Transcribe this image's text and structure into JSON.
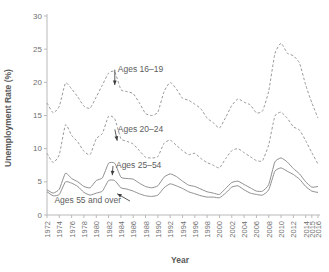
{
  "chart_data": {
    "type": "line",
    "title": "",
    "xlabel": "Year",
    "ylabel": "Unemployment Rate (%)",
    "xlim": [
      1972,
      2016
    ],
    "ylim": [
      0,
      30
    ],
    "yticks": [
      0,
      5,
      10,
      15,
      20,
      25,
      30
    ],
    "ytick_labels": [
      "0",
      "5",
      "10",
      "15",
      "20",
      "25",
      "30"
    ],
    "xticks": [
      1972,
      1974,
      1976,
      1978,
      1980,
      1982,
      1984,
      1986,
      1988,
      1990,
      1992,
      1994,
      1996,
      1998,
      2000,
      2002,
      2004,
      2006,
      2008,
      2010,
      2012,
      2014,
      2015,
      2016
    ],
    "xtick_labels": [
      "1972",
      "1974",
      "1976",
      "1978",
      "1980",
      "1982",
      "1984",
      "1986",
      "1988",
      "1990",
      "1992",
      "1994",
      "1996",
      "1998",
      "2000",
      "2002",
      "2004",
      "2006",
      "2008",
      "2010",
      "2012",
      "2014",
      "2015",
      "2016"
    ],
    "grid": false,
    "legend_position": "inline-annotations",
    "x": [
      1972,
      1973,
      1974,
      1975,
      1976,
      1977,
      1978,
      1979,
      1980,
      1981,
      1982,
      1983,
      1984,
      1985,
      1986,
      1987,
      1988,
      1989,
      1990,
      1991,
      1992,
      1993,
      1994,
      1995,
      1996,
      1997,
      1998,
      1999,
      2000,
      2001,
      2002,
      2003,
      2004,
      2005,
      2006,
      2007,
      2008,
      2009,
      2010,
      2011,
      2012,
      2013,
      2014,
      2015,
      2016
    ],
    "series": [
      {
        "name": "Ages 16-19",
        "style": "dashed",
        "color": "#9a9a9a",
        "values": [
          16.9,
          15.4,
          16.4,
          19.9,
          19.0,
          17.8,
          16.4,
          16.1,
          17.8,
          19.6,
          21.4,
          21.6,
          18.9,
          18.6,
          18.3,
          16.9,
          15.3,
          15.0,
          15.5,
          18.6,
          20.0,
          19.0,
          17.6,
          17.3,
          16.7,
          16.0,
          14.6,
          13.9,
          13.1,
          14.7,
          16.5,
          17.5,
          17.0,
          16.6,
          15.4,
          15.7,
          18.7,
          24.3,
          25.9,
          24.4,
          24.0,
          22.9,
          19.6,
          16.9,
          14.6
        ]
      },
      {
        "name": "Ages 20-24",
        "style": "dashed",
        "color": "#9a9a9a",
        "values": [
          9.3,
          7.9,
          9.1,
          13.6,
          12.0,
          11.0,
          9.6,
          9.1,
          11.5,
          12.3,
          14.9,
          14.5,
          11.5,
          11.1,
          10.7,
          9.7,
          8.7,
          8.6,
          8.8,
          10.8,
          11.3,
          10.5,
          9.7,
          9.1,
          9.3,
          8.5,
          7.9,
          7.5,
          7.1,
          8.5,
          9.7,
          10.0,
          9.4,
          8.8,
          8.2,
          8.2,
          10.6,
          14.9,
          15.5,
          14.6,
          13.3,
          12.8,
          11.2,
          9.4,
          7.7
        ]
      },
      {
        "name": "Ages 25-54",
        "style": "solid",
        "color": "#8f8f8f",
        "values": [
          3.8,
          3.3,
          3.9,
          6.3,
          5.5,
          5.0,
          4.3,
          4.1,
          5.2,
          5.6,
          7.8,
          7.8,
          5.7,
          5.5,
          5.4,
          4.8,
          4.3,
          4.1,
          4.4,
          5.7,
          6.2,
          5.8,
          5.1,
          4.5,
          4.3,
          3.9,
          3.5,
          3.3,
          3.1,
          4.0,
          4.9,
          5.1,
          4.6,
          4.1,
          3.6,
          3.6,
          4.6,
          8.0,
          8.6,
          8.0,
          7.0,
          6.2,
          5.0,
          4.2,
          4.3
        ]
      },
      {
        "name": "Ages 55 and over",
        "style": "solid",
        "color": "#8f8f8f",
        "values": [
          3.5,
          2.9,
          3.1,
          5.0,
          4.8,
          4.3,
          3.4,
          3.0,
          3.3,
          3.6,
          5.2,
          5.2,
          4.1,
          3.9,
          3.6,
          3.2,
          2.9,
          2.8,
          3.0,
          4.1,
          4.7,
          4.4,
          4.0,
          3.5,
          3.2,
          2.9,
          2.7,
          2.7,
          2.6,
          3.3,
          4.2,
          4.4,
          3.8,
          3.3,
          3.1,
          3.0,
          3.8,
          6.6,
          7.1,
          6.6,
          6.1,
          5.4,
          4.3,
          3.6,
          3.4
        ]
      }
    ],
    "annotations": [
      {
        "id": "ages-16-19",
        "label": "Ages 16–19",
        "label_x": 1983.5,
        "label_y": 21.9,
        "point_x": 1983.0,
        "point_y": 19.6
      },
      {
        "id": "ages-20-24",
        "label": "Ages 20–24",
        "label_x": 1983.5,
        "label_y": 12.9,
        "point_x": 1983.4,
        "point_y": 11.2
      },
      {
        "id": "ages-25-54",
        "label": "Ages 25–54",
        "label_x": 1983.2,
        "label_y": 7.4,
        "point_x": 1982.6,
        "point_y": 6.0
      },
      {
        "id": "ages-55-and-over",
        "label": "Ages 55 and over",
        "label_x": 1973.2,
        "label_y": 2.1,
        "point_x": 1983.4,
        "point_y": 3.2
      }
    ]
  }
}
